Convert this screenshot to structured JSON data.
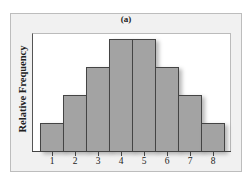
{
  "chart_data": {
    "type": "bar",
    "title": "(a)",
    "xlabel": "",
    "ylabel": "Relative Frequency",
    "categories": [
      "1",
      "2",
      "3",
      "4",
      "5",
      "6",
      "7",
      "8"
    ],
    "values": [
      1,
      2,
      3,
      4,
      4,
      3,
      2,
      1
    ],
    "value_units": "relative (no y-axis ticks shown)",
    "ylim": [
      0,
      4.2
    ],
    "grid": false,
    "legend": null,
    "bar_color": "#a3a3a3",
    "edge_color": "#444444",
    "histogram": true
  },
  "labels": {
    "title": "(a)",
    "ylabel": "Relative Frequency",
    "ticks": [
      "1",
      "2",
      "3",
      "4",
      "5",
      "6",
      "7",
      "8"
    ]
  }
}
